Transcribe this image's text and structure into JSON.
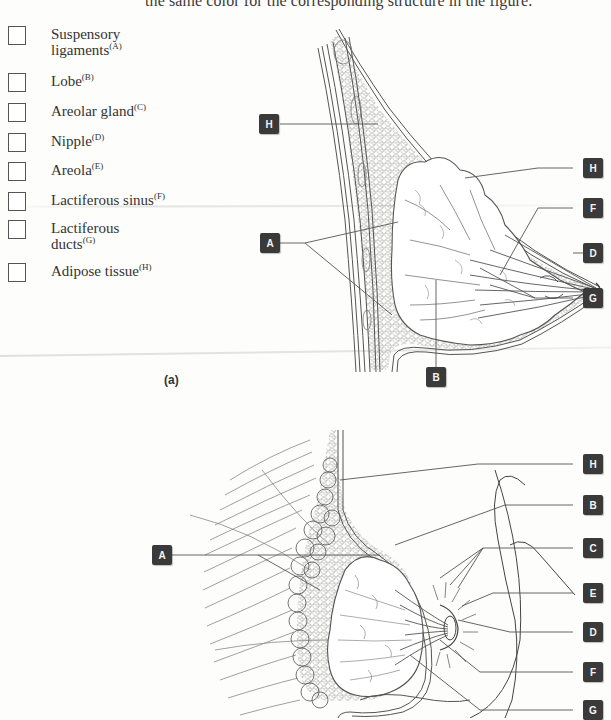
{
  "instruction": "the same color for the corresponding structure in the figure.",
  "legend": {
    "items": [
      {
        "label": "Suspensory ligaments",
        "key": "(A)"
      },
      {
        "label": "Lobe",
        "key": "(B)"
      },
      {
        "label": "Areolar gland",
        "key": "(C)"
      },
      {
        "label": "Nipple",
        "key": "(D)"
      },
      {
        "label": "Areola",
        "key": "(E)"
      },
      {
        "label": "Lactiferous sinus",
        "key": "(F)"
      },
      {
        "label": "Lactiferous ducts",
        "key": "(G)"
      },
      {
        "label": "Adipose tissue",
        "key": "(H)"
      }
    ]
  },
  "figure_a": {
    "caption": "(a)",
    "labels": [
      "H",
      "H",
      "F",
      "A",
      "D",
      "G",
      "B"
    ]
  },
  "figure_b": {
    "labels": [
      "H",
      "B",
      "A",
      "C",
      "E",
      "D",
      "F",
      "G"
    ]
  },
  "colors": {
    "tag_bg": "#3a3a3a",
    "tag_text": "#f4f4f4",
    "line": "#555555"
  }
}
